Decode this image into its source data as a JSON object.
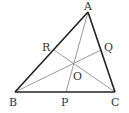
{
  "diagram": {
    "type": "triangle-cevians",
    "points": {
      "A": {
        "label": "A",
        "x": 88,
        "y": 12
      },
      "B": {
        "label": "B",
        "x": 15,
        "y": 92
      },
      "C": {
        "label": "C",
        "x": 115,
        "y": 92
      },
      "R": {
        "label": "R",
        "x": 54,
        "y": 50
      },
      "Q": {
        "label": "Q",
        "x": 101,
        "y": 50
      },
      "P": {
        "label": "P",
        "x": 66,
        "y": 92
      },
      "O": {
        "label": "O",
        "x": 73,
        "y": 62
      }
    },
    "sides": [
      "AB",
      "BC",
      "CA"
    ],
    "cevians": [
      "AP",
      "BQ",
      "CR"
    ],
    "colors": {
      "side": "#222222",
      "cevian": "#9a9a9a",
      "label": "#333333"
    }
  }
}
